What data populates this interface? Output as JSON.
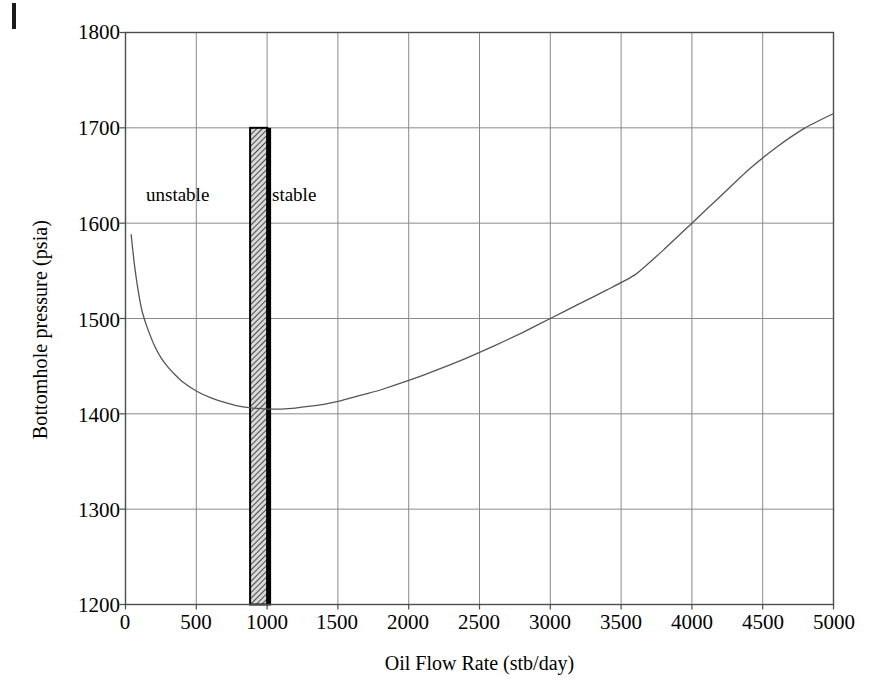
{
  "chart_data": {
    "type": "line",
    "title": "",
    "xlabel": "Oil Flow Rate (stb/day)",
    "ylabel": "Bottomhole pressure (psia)",
    "xlim": [
      0,
      5000
    ],
    "ylim": [
      1200,
      1800
    ],
    "xticks": [
      "0",
      "500",
      "1000",
      "1500",
      "2000",
      "2500",
      "3000",
      "3500",
      "4000",
      "4500",
      "5000"
    ],
    "yticks": [
      "1200",
      "1300",
      "1400",
      "1500",
      "1600",
      "1700",
      "1800"
    ],
    "grid": true,
    "legend": "none",
    "series": [
      {
        "name": "Tubing performance curve",
        "x": [
          40,
          60,
          80,
          100,
          120,
          150,
          200,
          250,
          300,
          350,
          400,
          500,
          600,
          700,
          800,
          900,
          1000,
          1100,
          1200,
          1300,
          1400,
          1500,
          1600,
          1700,
          1800,
          2000,
          2200,
          2400,
          2600,
          2800,
          3000,
          3200,
          3400,
          3600,
          3800,
          4000,
          4200,
          4400,
          4600,
          4800,
          5000
        ],
        "y": [
          1588,
          1560,
          1538,
          1520,
          1506,
          1492,
          1473,
          1459,
          1449,
          1441,
          1434,
          1424,
          1417,
          1412,
          1408,
          1406,
          1405,
          1405,
          1406,
          1408,
          1410,
          1413,
          1417,
          1421,
          1425,
          1435,
          1446,
          1458,
          1471,
          1485,
          1500,
          1515,
          1530,
          1546,
          1572,
          1600,
          1628,
          1656,
          1680,
          1700,
          1715
        ]
      }
    ],
    "annotations": [
      {
        "name": "stability-band",
        "kind": "shaded-vertical-band",
        "x_start": 880,
        "x_end": 1000,
        "y_top": 1700,
        "y_bottom": 1200,
        "fill": "#8c8c8c",
        "edge": "#000000"
      }
    ]
  },
  "labels": {
    "unstable": "unstable",
    "stable": "stable"
  },
  "axis": {
    "x_title": "Oil Flow Rate (stb/day)",
    "y_title": "Bottomhole pressure (psia)",
    "x_ticks": [
      "0",
      "500",
      "1000",
      "1500",
      "2000",
      "2500",
      "3000",
      "3500",
      "4000",
      "4500",
      "5000"
    ],
    "y_ticks": [
      "1800",
      "1700",
      "1600",
      "1500",
      "1400",
      "1300",
      "1200"
    ]
  },
  "colors": {
    "curve": "#555555",
    "axis": "#4d4d4d",
    "grid": "#8a8a8a",
    "band_fill": "#8c8c8c",
    "band_edge": "#000000",
    "text": "#000000",
    "background": "#ffffff"
  }
}
